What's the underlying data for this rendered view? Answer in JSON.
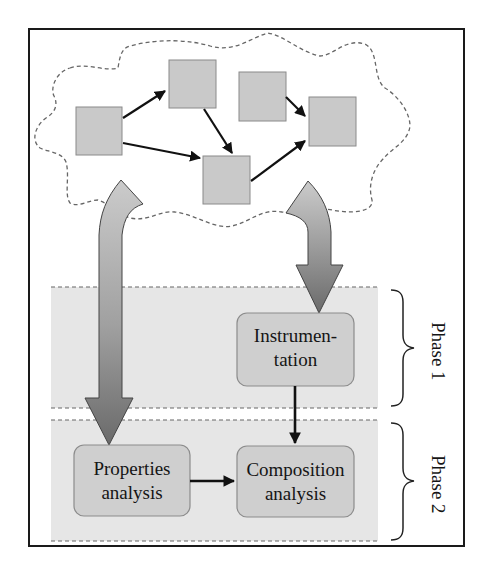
{
  "diagram": {
    "colors": {
      "frame": "#1a1a1a",
      "node_fill": "#c9c9c9",
      "node_stroke": "#8a8a8a",
      "phase_band": "#e6e6e6",
      "process_box_fill": "#cfcfcf",
      "process_box_stroke": "#8c8c8c",
      "arrow_gradient_top": "#c8c8c8",
      "arrow_gradient_bottom": "#6e6e6e",
      "dash": "#666666"
    },
    "cloud": {
      "nodes": [
        {
          "id": "node-a",
          "x": 76,
          "y": 107,
          "w": 46,
          "h": 48
        },
        {
          "id": "node-b",
          "x": 169,
          "y": 60,
          "w": 47,
          "h": 48
        },
        {
          "id": "node-c",
          "x": 239,
          "y": 72,
          "w": 47,
          "h": 49
        },
        {
          "id": "node-d",
          "x": 309,
          "y": 97,
          "w": 47,
          "h": 49
        },
        {
          "id": "node-e",
          "x": 203,
          "y": 156,
          "w": 47,
          "h": 48
        }
      ],
      "edges": [
        {
          "from": "node-a",
          "to": "node-b"
        },
        {
          "from": "node-a",
          "to": "node-e"
        },
        {
          "from": "node-b",
          "to": "node-e"
        },
        {
          "from": "node-c",
          "to": "node-d"
        },
        {
          "from": "node-e",
          "to": "node-d"
        }
      ]
    },
    "boxes": {
      "instrumentation": {
        "line1": "Instrumen-",
        "line2": "tation"
      },
      "properties": {
        "line1": "Properties",
        "line2": "analysis"
      },
      "composition": {
        "line1": "Composition",
        "line2": "analysis"
      }
    },
    "phases": [
      {
        "label": "Phase 1"
      },
      {
        "label": "Phase 2"
      }
    ],
    "flows": [
      {
        "from": "cloud",
        "to": "instrumentation",
        "style": "wide-gradient-arrow"
      },
      {
        "from": "cloud",
        "to": "properties",
        "style": "wide-gradient-arrow"
      },
      {
        "from": "instrumentation",
        "to": "composition",
        "style": "thin-arrow"
      },
      {
        "from": "properties",
        "to": "composition",
        "style": "thin-arrow"
      }
    ]
  }
}
